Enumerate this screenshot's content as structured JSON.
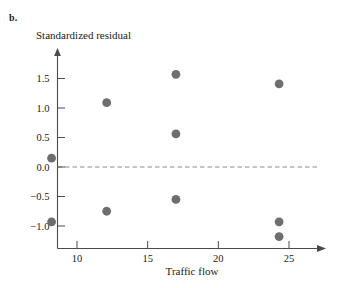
{
  "figure": {
    "panel_label": "b.",
    "y_axis_title": "Standardized residual",
    "x_axis_title": "Traffic flow"
  },
  "chart_data": {
    "type": "scatter",
    "title": "",
    "panel": "b.",
    "xlabel": "Traffic flow",
    "ylabel": "Standardized residual",
    "xlim": [
      6.5,
      27.5
    ],
    "ylim": [
      -1.45,
      1.85
    ],
    "xticks": [
      10,
      15,
      20,
      25
    ],
    "xtick_labels": [
      "10",
      "15",
      "20",
      "25"
    ],
    "yticks": [
      1.5,
      1.0,
      0.5,
      0.0,
      -0.5,
      -1.0
    ],
    "ytick_labels": [
      "1.5",
      "1.0",
      "0.5",
      "0.0",
      "−0.5",
      "−1.0"
    ],
    "grid": false,
    "legend": null,
    "reference_line": {
      "type": "horizontal",
      "y": 0.0,
      "style": "dashed",
      "color": "#8c8c8c"
    },
    "marker": {
      "shape": "circle",
      "size": 4.4,
      "color": "#6e6e72"
    },
    "points": [
      {
        "x": 8.2,
        "y": 0.15
      },
      {
        "x": 8.2,
        "y": -0.93
      },
      {
        "x": 12.1,
        "y": 1.09
      },
      {
        "x": 12.1,
        "y": -0.75
      },
      {
        "x": 17.0,
        "y": 1.57
      },
      {
        "x": 17.0,
        "y": 0.56
      },
      {
        "x": 17.0,
        "y": -0.55
      },
      {
        "x": 24.3,
        "y": 1.41
      },
      {
        "x": 24.3,
        "y": -0.93
      },
      {
        "x": 24.3,
        "y": -1.18
      }
    ]
  }
}
